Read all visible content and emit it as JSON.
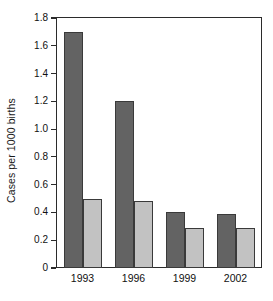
{
  "chart_data": {
    "type": "bar",
    "title": "",
    "subtitle": "",
    "xlabel": "",
    "ylabel": "Cases per 1000 births",
    "categories": [
      "1993",
      "1996",
      "1999",
      "2002"
    ],
    "series": [
      {
        "name": "dark-series",
        "color": "#636363",
        "values": [
          1.7,
          1.2,
          0.4,
          0.39
        ]
      },
      {
        "name": "light-series",
        "color": "#c2c2c2",
        "values": [
          0.5,
          0.48,
          0.29,
          0.29
        ]
      }
    ],
    "ylim": [
      0,
      1.8
    ],
    "yticks": [
      "0",
      "0.2",
      "0.4",
      "0.6",
      "0.8",
      "1.0",
      "1.2",
      "1.4",
      "1.6",
      "1.8"
    ],
    "ytick_values": [
      0,
      0.2,
      0.4,
      0.6,
      0.8,
      1.0,
      1.2,
      1.4,
      1.6,
      1.8
    ],
    "grid": false,
    "legend": "none",
    "legend_position": "none",
    "frame": "full-box",
    "annotations": []
  },
  "axis": {
    "y_title": "Cases per 1000 births"
  }
}
